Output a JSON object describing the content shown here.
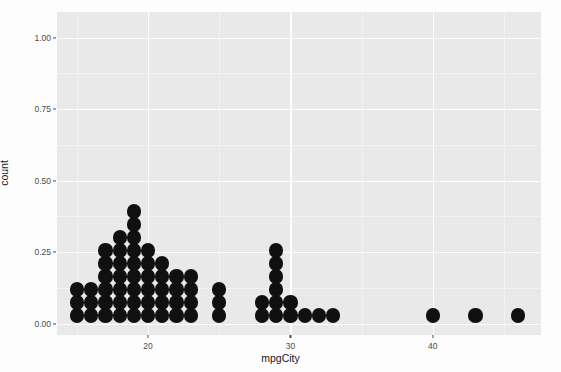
{
  "chart_data": {
    "type": "scatter",
    "plot_kind": "dotplot",
    "title": "",
    "subtitle": "",
    "xlabel": "mpgCity",
    "ylabel": "count",
    "xlim": [
      13.6,
      47.6
    ],
    "ylim": [
      -0.04,
      1.09
    ],
    "grid": true,
    "legend": null,
    "legend_position": "none",
    "x_ticks": [
      20,
      30,
      40
    ],
    "x_tick_labels": [
      "20",
      "30",
      "40"
    ],
    "x_minor_ticks": [
      15,
      25,
      35,
      45
    ],
    "y_ticks": [
      0.0,
      0.25,
      0.5,
      0.75,
      1.0
    ],
    "y_tick_labels": [
      "0.00",
      "0.25",
      "0.50",
      "0.75",
      "1.00"
    ],
    "y_minor_ticks": [
      0.125,
      0.375,
      0.625,
      0.875
    ],
    "dot_color": "#101010",
    "panel_color": "#ebebeb",
    "gridline_color": "#ffffff",
    "binwidth": 1,
    "dot_diameter_units": 1,
    "stack_step": 0.0455,
    "categories": [
      15,
      16,
      17,
      18,
      19,
      20,
      21,
      22,
      23,
      25,
      28,
      29,
      30,
      31,
      32,
      33,
      40,
      43,
      46
    ],
    "values": [
      3,
      3,
      6,
      7,
      9,
      6,
      5,
      4,
      4,
      3,
      2,
      6,
      2,
      1,
      1,
      1,
      1,
      1,
      1
    ],
    "points": [
      {
        "x": 15,
        "stack": 3
      },
      {
        "x": 16,
        "stack": 3
      },
      {
        "x": 17,
        "stack": 6
      },
      {
        "x": 18,
        "stack": 7
      },
      {
        "x": 19,
        "stack": 9
      },
      {
        "x": 20,
        "stack": 6
      },
      {
        "x": 21,
        "stack": 5
      },
      {
        "x": 22,
        "stack": 4
      },
      {
        "x": 23,
        "stack": 4
      },
      {
        "x": 25,
        "stack": 3
      },
      {
        "x": 28,
        "stack": 2
      },
      {
        "x": 29,
        "stack": 6
      },
      {
        "x": 30,
        "stack": 2
      },
      {
        "x": 31,
        "stack": 1
      },
      {
        "x": 32,
        "stack": 1
      },
      {
        "x": 33,
        "stack": 1
      },
      {
        "x": 40,
        "stack": 1
      },
      {
        "x": 43,
        "stack": 1
      },
      {
        "x": 46,
        "stack": 1
      }
    ],
    "total_observations": 57
  }
}
